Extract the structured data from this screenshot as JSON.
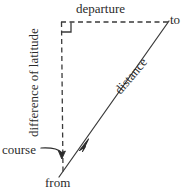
{
  "figure": {
    "type": "geometry-diagram",
    "canvas": {
      "width": 188,
      "height": 192,
      "background": "#ffffff"
    },
    "stroke_color": "#3a3a3a",
    "text_color": "#2b2b2b"
  },
  "labels": {
    "departure": "departure",
    "to": "to",
    "from": "from",
    "course": "course",
    "difference_of_latitude": "difference of latitude",
    "distance": "distance"
  },
  "geometry": {
    "vertices": {
      "from": {
        "x": 63,
        "y": 170
      },
      "corner": {
        "x": 61,
        "y": 22
      },
      "to": {
        "x": 168,
        "y": 22
      }
    },
    "edges": [
      {
        "name": "difference-of-latitude",
        "style": "dashed",
        "from": "corner",
        "to": "from"
      },
      {
        "name": "departure",
        "style": "dashed",
        "from": "corner",
        "to": "to"
      },
      {
        "name": "distance",
        "style": "solid",
        "from": "from",
        "to": "to"
      }
    ],
    "right_angle_marker": {
      "at": "corner",
      "size": 9
    },
    "distance_arrowhead": {
      "x": 86,
      "y": 142,
      "points_toward": "to"
    },
    "course_arrow": {
      "label_anchor": {
        "x": 43,
        "y": 148
      },
      "tip": {
        "x": 62,
        "y": 157
      },
      "points_toward": "course-angle-at-from"
    }
  }
}
